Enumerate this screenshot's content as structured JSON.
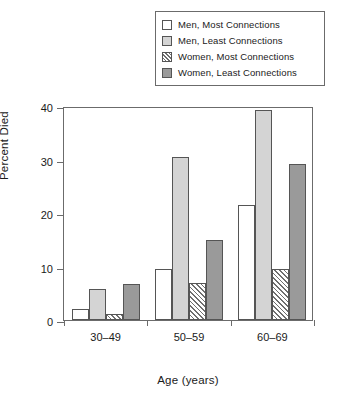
{
  "chart_data": {
    "type": "bar",
    "title": "",
    "xlabel": "Age (years)",
    "ylabel": "Percent Died",
    "categories": [
      "30–49",
      "50–59",
      "60–69"
    ],
    "ylim": [
      0,
      40
    ],
    "yticks": [
      0,
      10,
      20,
      30,
      40
    ],
    "ytick_labels": [
      "0",
      "10",
      "20",
      "30",
      "40"
    ],
    "grid": false,
    "legend_position": "top-right",
    "series": [
      {
        "name": "Men, Most Connections",
        "swatch": "white",
        "color": "#ffffff",
        "values": [
          2.0,
          9.5,
          21.5
        ]
      },
      {
        "name": "Men, Least Connections",
        "swatch": "light-gray",
        "color": "#d4d4d4",
        "values": [
          5.8,
          30.5,
          39.2
        ]
      },
      {
        "name": "Women, Most Connections",
        "swatch": "hatched",
        "color": "#ffffff",
        "values": [
          1.2,
          6.9,
          9.6
        ]
      },
      {
        "name": "Women, Least Connections",
        "swatch": "dark-gray",
        "color": "#9a9a9a",
        "values": [
          6.7,
          15.0,
          29.2
        ]
      }
    ]
  },
  "legend": {
    "items": [
      {
        "label": "Men, Most Connections"
      },
      {
        "label": "Men, Least Connections"
      },
      {
        "label": "Women, Most Connections"
      },
      {
        "label": "Women, Least Connections"
      }
    ]
  },
  "axes": {
    "y_title": "Percent Died",
    "x_title": "Age (years)",
    "y_ticks": [
      "40",
      "30",
      "20",
      "10",
      "0"
    ],
    "x_ticks": [
      "30–49",
      "50–59",
      "60–69"
    ]
  }
}
